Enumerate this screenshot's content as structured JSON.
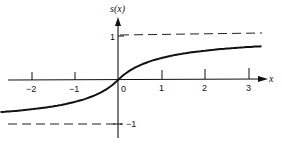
{
  "chart_data": {
    "type": "line",
    "title": "",
    "xlabel": "x",
    "ylabel": "s(x)",
    "function": "s(x) = x / (1 + |x|)",
    "xlim": [
      -2.7,
      3.3
    ],
    "ylim": [
      -1.25,
      1.5
    ],
    "x_ticks": [
      -2,
      -1,
      0,
      1,
      2,
      3
    ],
    "x_tick_labels": [
      "−2",
      "−1",
      "0",
      "1",
      "2",
      "3"
    ],
    "y_ticks": [
      1,
      -1
    ],
    "y_tick_labels": [
      "1",
      "−1"
    ],
    "asymptotes": [
      {
        "y": 1,
        "style": "dashed"
      },
      {
        "y": -1,
        "style": "dashed"
      }
    ],
    "series": [
      {
        "name": "s(x)",
        "x": [
          -2.7,
          -2,
          -1.5,
          -1,
          -0.5,
          0,
          0.5,
          1,
          1.5,
          2,
          2.5,
          3,
          3.3
        ],
        "values": [
          -0.73,
          -0.67,
          -0.6,
          -0.5,
          -0.33,
          0,
          0.33,
          0.5,
          0.6,
          0.67,
          0.71,
          0.75,
          0.77
        ]
      }
    ],
    "grid": false,
    "legend": null
  },
  "labels": {
    "ylabel": "s(x)",
    "xlabel": "x",
    "tick_neg2": "−2",
    "tick_neg1": "−1",
    "tick_0": "0",
    "tick_1": "1",
    "tick_2": "2",
    "tick_3": "3",
    "ytick_1": "1",
    "ytick_neg1": "−1"
  }
}
